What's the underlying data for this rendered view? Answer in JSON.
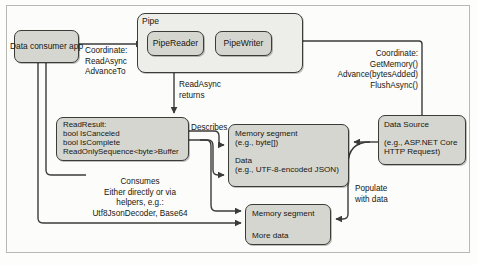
{
  "diagram": {
    "colors": {
      "node_fill": "#d6d6d1",
      "container_fill": "#ededea",
      "stroke": "#3b3b38",
      "text": "#16160f",
      "frame": "#b9b9b4",
      "page": "#fdfdfc"
    },
    "nodes": {
      "consumer": {
        "label": "Data consumer app"
      },
      "pipe": {
        "label": "Pipe"
      },
      "pipe_reader": {
        "label": "PipeReader"
      },
      "pipe_writer": {
        "label": "PipeWriter"
      },
      "read_result": {
        "title": "ReadResult:",
        "fields": [
          "bool IsCanceled",
          "bool IsComplete",
          "ReadOnlySequence<byte>Buffer"
        ]
      },
      "memory_segment_1": {
        "title": "Memory segment",
        "subtitle": "(e.g., byte[])",
        "data_title": "Data",
        "data_subtitle": "(e.g., UTF-8-encoded JSON)"
      },
      "memory_segment_2": {
        "title": "Memory segment",
        "subtitle": "More data"
      },
      "data_source": {
        "title": "Data Source",
        "detail_line1": "(e.g., ASP.NET Core",
        "detail_line2": "HTTP Request)"
      }
    },
    "edge_labels": {
      "coordinate_read": {
        "line1": "Coordinate:",
        "line2": "ReadAsync",
        "line3": "AdvanceTo"
      },
      "read_async_returns": {
        "line1": "ReadAsync",
        "line2": "returns"
      },
      "coordinate_write": {
        "line1": "Coordinate:",
        "line2": "GetMemory()",
        "line3": "Advance(bytesAdded)",
        "line4": "FlushAsync()"
      },
      "describes": {
        "line1": "Describes"
      },
      "consumes": {
        "line1": "Consumes",
        "line2": "Either directly or via",
        "line3": "helpers, e.g.:",
        "line4": "Utf8JsonDecoder, Base64"
      },
      "populate": {
        "line1": "Populate",
        "line2": "with data"
      }
    }
  }
}
